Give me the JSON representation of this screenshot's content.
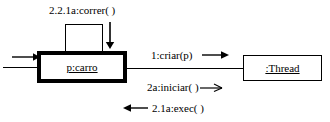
{
  "diagram": {
    "type": "uml-communication-diagram",
    "title": "",
    "background_color": "#ffffff",
    "line_color": "#000000"
  },
  "objects": [
    {
      "id": "carro",
      "label": "p:carro",
      "border_weight": "thick",
      "role": "active-object"
    },
    {
      "id": "thread",
      "label": ":Thread",
      "border_weight": "thin",
      "role": "object"
    }
  ],
  "messages": [
    {
      "id": "correr",
      "label": "2.2.1a:correr(  )",
      "direction": "self",
      "arrow": "filled-down"
    },
    {
      "id": "criar",
      "label": "1:criar(p)",
      "direction": "right",
      "arrow": "filled-right"
    },
    {
      "id": "iniciar",
      "label": "2a:iniciar(  )",
      "direction": "right",
      "arrow": "open-right"
    },
    {
      "id": "exec",
      "label": "2.1a:exec(  )",
      "direction": "left",
      "arrow": "filled-left"
    }
  ]
}
